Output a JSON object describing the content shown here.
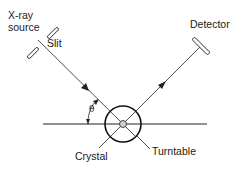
{
  "labels": {
    "xray_source_line1": "X-ray",
    "xray_source_line2": "source",
    "slit": "Slit",
    "detector": "Detector",
    "theta": "θ",
    "crystal": "Crystal",
    "turntable": "Turntable"
  },
  "colors": {
    "stroke": "#222222",
    "crystal_fill": "#cfcfcf"
  }
}
